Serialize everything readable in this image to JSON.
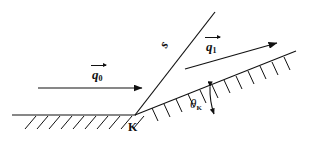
{
  "figure": {
    "background_color": "#ffffff",
    "ink_color": "#111111",
    "width": 327,
    "height": 146
  },
  "labels": {
    "incident_vector": {
      "base": "q",
      "subscript": "0",
      "has_overarrow": true
    },
    "scattered_vector": {
      "base": "q",
      "subscript": "1",
      "has_overarrow": true
    },
    "edge_line": {
      "text": "s"
    },
    "angle": {
      "base": "θ",
      "subscript": "K"
    },
    "vertex": {
      "text": "K"
    }
  },
  "geometry": {
    "vertex": {
      "x": 135,
      "y": 115
    },
    "horizontal_surface": {
      "x1": 12,
      "y1": 115,
      "x2": 135,
      "y2": 115
    },
    "inclined_surface": {
      "x1": 135,
      "y1": 115,
      "x2": 296,
      "y2": 51
    },
    "steep_edge_line": {
      "x1": 135,
      "y1": 115,
      "x2": 215,
      "y2": 12
    },
    "incident_arrow": {
      "x1": 38,
      "y1": 88,
      "x2": 146,
      "y2": 88
    },
    "scattered_arrow": {
      "x1": 185,
      "y1": 69,
      "x2": 281,
      "y2": 42
    },
    "angle_arc": {
      "center_x": 135,
      "center_y": 115,
      "radius": 78
    },
    "hatch_count_horizontal": 9,
    "hatch_count_inclined": 12
  }
}
